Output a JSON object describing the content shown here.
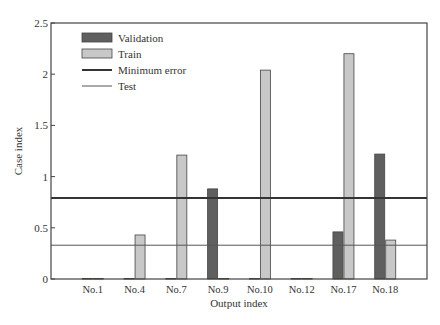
{
  "chart_data": {
    "type": "bar",
    "title": "",
    "xlabel": "Output index",
    "ylabel": "Case index",
    "ylim": [
      0,
      2.5
    ],
    "yticks": [
      0,
      0.5,
      1,
      1.5,
      2,
      2.5
    ],
    "ytick_labels": [
      "0",
      "0.5",
      "1",
      "1.5",
      "2",
      "2.5"
    ],
    "grid": false,
    "legend_position": "upper-left",
    "categories": [
      "No.1",
      "No.4",
      "No.7",
      "No.9",
      "No.10",
      "No.12",
      "No.17",
      "No.18"
    ],
    "series": [
      {
        "name": "Validation",
        "kind": "bar",
        "color": "#5f5f5f",
        "values": [
          0.005,
          0.005,
          0.005,
          0.88,
          0.005,
          0.005,
          0.46,
          1.22
        ]
      },
      {
        "name": "Train",
        "kind": "bar",
        "color": "#c8c8c8",
        "values": [
          0.005,
          0.43,
          1.21,
          0.005,
          2.04,
          0.005,
          2.2,
          0.38
        ]
      },
      {
        "name": "Minimum error",
        "kind": "hline",
        "color": "#333333",
        "linewidth": 2,
        "value": 0.79
      },
      {
        "name": "Test",
        "kind": "hline",
        "color": "#555555",
        "linewidth": 1,
        "value": 0.33
      }
    ]
  }
}
